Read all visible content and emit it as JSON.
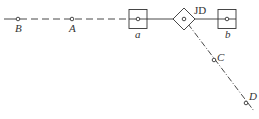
{
  "diagram": {
    "type": "survey-alignment-sketch",
    "points": [
      {
        "id": "B",
        "label": "B",
        "x": 18,
        "y": 19
      },
      {
        "id": "A",
        "label": "A",
        "x": 72,
        "y": 19
      },
      {
        "id": "a",
        "label": "a",
        "x": 138,
        "y": 19,
        "marker": "square"
      },
      {
        "id": "JD",
        "label": "JD",
        "x": 184,
        "y": 19,
        "marker": "diamond"
      },
      {
        "id": "b",
        "label": "b",
        "x": 227,
        "y": 19,
        "marker": "square"
      },
      {
        "id": "C",
        "label": "C",
        "x": 214,
        "y": 60
      },
      {
        "id": "D",
        "label": "D",
        "x": 246,
        "y": 103
      }
    ],
    "lines": [
      {
        "from": "start",
        "to": "B",
        "style": "solid"
      },
      {
        "from": "B",
        "to": "a",
        "style": "dashed"
      },
      {
        "from": "a",
        "to": "b",
        "style": "solid"
      },
      {
        "from": "JD",
        "to": "D",
        "style": "dash-dot"
      }
    ],
    "colors": {
      "stroke": "#333333",
      "background": "#ffffff"
    }
  }
}
